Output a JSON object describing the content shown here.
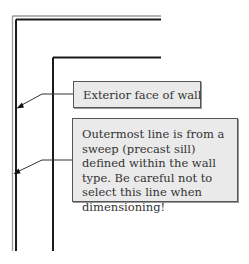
{
  "diagram": {
    "callouts": [
      {
        "id": "exterior-face",
        "text": "Exterior face of wall"
      },
      {
        "id": "outermost-line",
        "text": "Outermost line is from a sweep (precast sill) defined within the wall type. Be careful not to select this line when dimensioning!"
      }
    ],
    "colors": {
      "wall_line": "#1a1a1a",
      "sweep_line": "#8a8a8a",
      "callout_fill": "#eaeaea",
      "callout_border": "#555555",
      "leader": "#333333"
    }
  }
}
